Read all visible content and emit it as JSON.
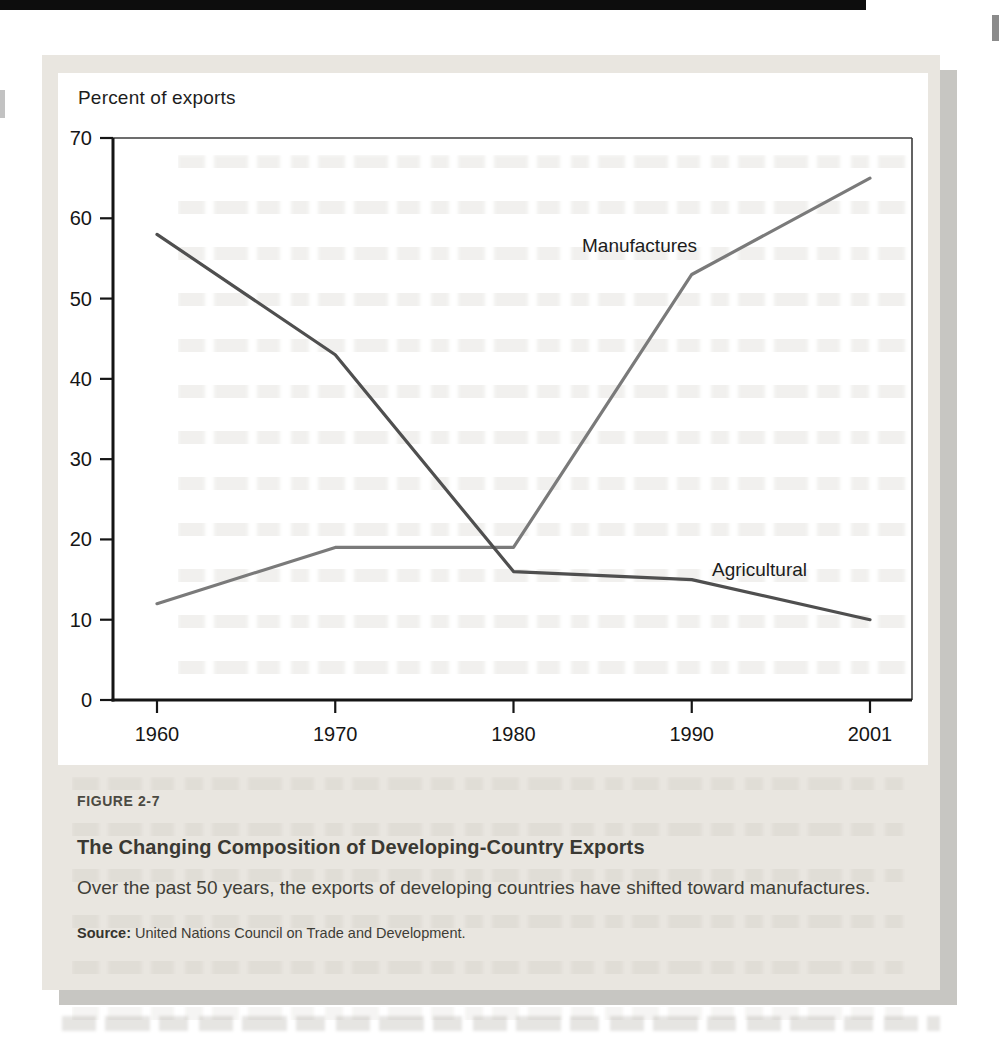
{
  "page": {
    "background_color": "#ffffff",
    "card_background_color": "#e9e6e0",
    "card_shadow_color": "#c7c6c2"
  },
  "chart_data": {
    "type": "line",
    "title": "",
    "ylabel": "Percent of exports",
    "xlabel": "",
    "categories": [
      "1960",
      "1970",
      "1980",
      "1990",
      "2001"
    ],
    "y_ticks": [
      0,
      10,
      20,
      30,
      40,
      50,
      60,
      70
    ],
    "ylim": [
      0,
      70
    ],
    "grid": "off",
    "legend_position": "inline-labels-on-plot",
    "series": [
      {
        "name": "Manufactures",
        "values": [
          12,
          19,
          19,
          53,
          65
        ],
        "color": "#7a7a7a"
      },
      {
        "name": "Agricultural",
        "values": [
          58,
          43,
          16,
          15,
          10
        ],
        "color": "#4f4f4f"
      }
    ],
    "axis_color": "#151515",
    "frame_color": "#3c3c3c",
    "tick_label_color": "#161616"
  },
  "caption": {
    "figure_label": "FIGURE 2-7",
    "title": "The Changing Composition of Developing-Country Exports",
    "body": "Over the past 50 years, the exports of developing countries have shifted toward manufactures.",
    "source_label": "Source:",
    "source_text": "United Nations Council on Trade and Development."
  }
}
